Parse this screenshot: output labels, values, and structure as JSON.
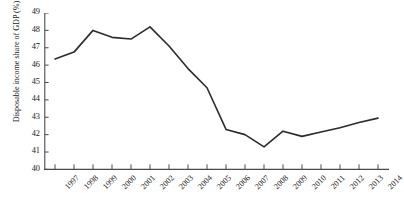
{
  "chart_data": {
    "type": "line",
    "title": "",
    "xlabel": "",
    "ylabel": "Disposable income share of GDP (%)",
    "categories": [
      "1997",
      "1998",
      "1999",
      "2000",
      "2001",
      "2002",
      "2003",
      "2004",
      "2005",
      "2006",
      "2007",
      "2008",
      "2009",
      "2010",
      "2011",
      "2012",
      "2013",
      "2014"
    ],
    "values": [
      46.35,
      46.75,
      48.0,
      47.6,
      47.5,
      48.2,
      47.1,
      45.8,
      44.7,
      42.3,
      42.0,
      41.3,
      42.2,
      41.9,
      42.15,
      42.4,
      42.7,
      42.95
    ],
    "series": [
      {
        "name": "Disposable income share of GDP",
        "values": [
          46.35,
          46.75,
          48.0,
          47.6,
          47.5,
          48.2,
          47.1,
          45.8,
          44.7,
          42.3,
          42.0,
          41.3,
          42.2,
          41.9,
          42.15,
          42.4,
          42.7,
          42.95
        ]
      }
    ],
    "ylim": [
      40,
      49
    ],
    "yticks": [
      "40",
      "41",
      "42",
      "43",
      "44",
      "45",
      "46",
      "47",
      "48",
      "49"
    ],
    "xticks": [
      "1997",
      "1998",
      "1999",
      "2000",
      "2001",
      "2002",
      "2003",
      "2004",
      "2005",
      "2006",
      "2007",
      "2008",
      "2009",
      "2010",
      "2011",
      "2012",
      "2013",
      "2014"
    ],
    "grid": false,
    "legend": "none",
    "line_color": "#2b2b2b",
    "axis_color": "#4a4a4a",
    "background_color": "#ffffff"
  }
}
